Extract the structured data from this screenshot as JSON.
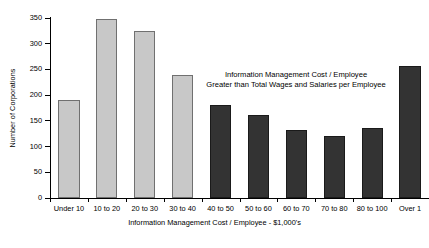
{
  "chart_data": {
    "type": "bar",
    "title": "",
    "xlabel": "Information Management Cost / Employee - $1,000's",
    "ylabel": "Number of Corporations",
    "categories": [
      "Under 10",
      "10 to 20",
      "20 to 30",
      "30 to 40",
      "40 to 50",
      "50 to 60",
      "60 to 70",
      "70 to 80",
      "80 to 100",
      "Over 1"
    ],
    "values": [
      190,
      348,
      324,
      239,
      180,
      162,
      133,
      121,
      137,
      257
    ],
    "bar_colors": [
      "#c8c8c8",
      "#c8c8c8",
      "#c8c8c8",
      "#c8c8c8",
      "#333333",
      "#333333",
      "#333333",
      "#333333",
      "#333333",
      "#333333"
    ],
    "ylim": [
      0,
      350
    ],
    "yticks": [
      0,
      50,
      100,
      150,
      200,
      250,
      300,
      350
    ],
    "ytick_labels": [
      "0",
      "50",
      "100",
      "150",
      "200",
      "250",
      "300",
      "350"
    ],
    "grid": false,
    "legend": null,
    "annotations": [
      {
        "line1": "Information Management Cost / Employee",
        "line2": "Greater than Total Wages and Salaries per Employee"
      }
    ]
  },
  "colors": {
    "light_bar": "#c8c8c8",
    "dark_bar": "#333333",
    "axis": "#000000",
    "background": "#ffffff"
  }
}
